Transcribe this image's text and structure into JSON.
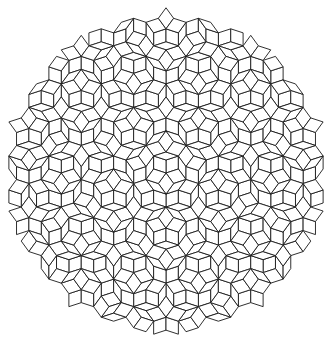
{
  "figure": {
    "type": "penrose-rhombus-tiling",
    "width": 333,
    "height": 346,
    "background": "#ffffff",
    "stroke_color": "#1a1a1a",
    "tile_types": [
      "thick-rhomb",
      "thin-rhomb"
    ],
    "edge_length_px": 13,
    "center": [
      166,
      173
    ],
    "radius_px": 158
  }
}
